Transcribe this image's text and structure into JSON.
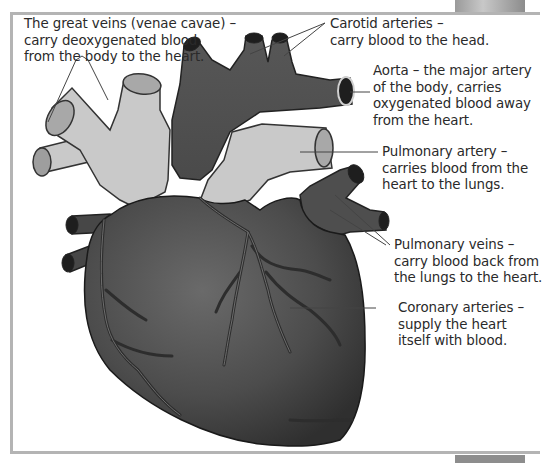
{
  "diagram": {
    "colors": {
      "heart_body": "#555555",
      "heart_dark": "#3a3a3a",
      "vein_light": "#c9c9c9",
      "vessel_lumen": "#1e1e1e",
      "frame_border": "#b4b4b4",
      "leader_line": "#444444",
      "text": "#2a2a2a"
    },
    "labels": [
      {
        "id": "great-veins",
        "lines": [
          "The great veins (venae cavae) –",
          "carry deoxygenated blood",
          "from the body to the heart."
        ]
      },
      {
        "id": "carotid-arteries",
        "lines": [
          "Carotid arteries –",
          "carry blood to the head."
        ]
      },
      {
        "id": "aorta",
        "lines": [
          "Aorta – the major artery",
          "of the body, carries",
          "oxygenated blood away",
          "from the heart."
        ]
      },
      {
        "id": "pulmonary-artery",
        "lines": [
          "Pulmonary artery –",
          "carries blood from the",
          "heart to the lungs."
        ]
      },
      {
        "id": "pulmonary-veins",
        "lines": [
          "Pulmonary veins –",
          "carry blood back from",
          "the lungs to the heart."
        ]
      },
      {
        "id": "coronary-arteries",
        "lines": [
          "Coronary arteries –",
          "supply the heart",
          "itself with blood."
        ]
      }
    ]
  }
}
